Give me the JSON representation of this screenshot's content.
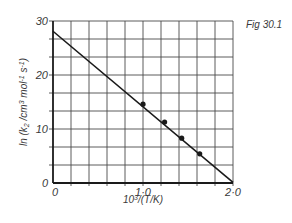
{
  "figure_label": "Fig 30.1",
  "chart_data": {
    "type": "scatter",
    "title": "",
    "xlabel": "10^3/(T/K)",
    "ylabel": "ln (k2 /cm3 mol-1 s-1)",
    "xlim": [
      0,
      2.0
    ],
    "ylim": [
      0,
      30
    ],
    "x_ticks": [
      0,
      1.0,
      2.0
    ],
    "x_tick_labels": [
      "0",
      "1·0",
      "2·0"
    ],
    "y_ticks": [
      0,
      10,
      20,
      30
    ],
    "y_tick_labels": [
      "0",
      "10",
      "20",
      "30"
    ],
    "grid": true,
    "grid_x_step": 0.2,
    "grid_y_step": 3.333,
    "series": [
      {
        "name": "data",
        "x": [
          1.0,
          1.24,
          1.43,
          1.63
        ],
        "y": [
          14.6,
          11.3,
          8.3,
          5.4
        ],
        "marker": "filled-circle"
      },
      {
        "name": "fitted line",
        "style": "line",
        "x": [
          0,
          2.0
        ],
        "y": [
          28.1,
          0.1
        ]
      }
    ],
    "annotations": [
      "Fig 30.1"
    ]
  },
  "colors": {
    "ink": "#1a1a1a",
    "grid": "#4a4a4a",
    "background": "#ffffff"
  }
}
